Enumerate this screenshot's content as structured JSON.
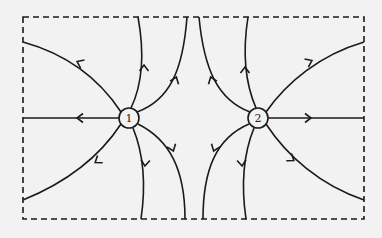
{
  "diagram": {
    "type": "electric-field-lines",
    "background": "#f2f2f2",
    "stroke_color": "#1a1a1a",
    "border": {
      "style": "dashed",
      "x": 23,
      "y": 17,
      "width": 341,
      "height": 202
    },
    "charges": [
      {
        "id": "charge-1",
        "label": "1",
        "cx": 129,
        "cy": 118,
        "r": 10,
        "field_direction": "outward"
      },
      {
        "id": "charge-2",
        "label": "2",
        "cx": 258,
        "cy": 118,
        "r": 10,
        "field_direction": "outward"
      }
    ],
    "field_lines": [
      {
        "name": "c1-left-horizontal",
        "d": "M119,118 L23,118",
        "arrow": {
          "x": 78,
          "y": 118,
          "angle": 180
        }
      },
      {
        "name": "c1-upper-left",
        "d": "M121,112 C100,80 70,55 23,42",
        "arrow": {
          "x": 78,
          "y": 62,
          "angle": 205
        }
      },
      {
        "name": "c1-lower-left",
        "d": "M121,124 C100,156 70,181 23,200",
        "arrow": {
          "x": 96,
          "y": 162,
          "angle": 145
        }
      },
      {
        "name": "c1-up-1",
        "d": "M131,108 C142,85 145,55 138,17",
        "arrow": {
          "x": 144,
          "y": 66,
          "angle": 270
        }
      },
      {
        "name": "c1-up-2",
        "d": "M137,112 C170,100 183,70 187,17",
        "arrow": {
          "x": 176,
          "y": 78,
          "angle": 290
        }
      },
      {
        "name": "c1-down-1",
        "d": "M133,128 C144,155 146,185 141,219",
        "arrow": {
          "x": 145,
          "y": 165,
          "angle": 95
        }
      },
      {
        "name": "c1-down-2",
        "d": "M138,124 C170,140 185,170 185,219",
        "arrow": {
          "x": 173,
          "y": 150,
          "angle": 70
        }
      },
      {
        "name": "c2-right-horizontal",
        "d": "M268,118 L364,118",
        "arrow": {
          "x": 310,
          "y": 118,
          "angle": 0
        }
      },
      {
        "name": "c2-upper-right",
        "d": "M266,112 C287,82 320,55 364,42",
        "arrow": {
          "x": 311,
          "y": 61,
          "angle": -25
        }
      },
      {
        "name": "c2-lower-right",
        "d": "M266,124 C287,156 320,185 364,200",
        "arrow": {
          "x": 293,
          "y": 160,
          "angle": 35
        }
      },
      {
        "name": "c2-up-1",
        "d": "M256,108 C246,85 242,55 248,17",
        "arrow": {
          "x": 245,
          "y": 68,
          "angle": 270
        }
      },
      {
        "name": "c2-up-2",
        "d": "M250,112 C218,100 204,70 199,17",
        "arrow": {
          "x": 211,
          "y": 78,
          "angle": 250
        }
      },
      {
        "name": "c2-down-1",
        "d": "M254,128 C243,155 241,185 246,219",
        "arrow": {
          "x": 242,
          "y": 165,
          "angle": 85
        }
      },
      {
        "name": "c2-down-2",
        "d": "M249,124 C216,138 203,170 203,219",
        "arrow": {
          "x": 214,
          "y": 150,
          "angle": 110
        }
      }
    ]
  }
}
